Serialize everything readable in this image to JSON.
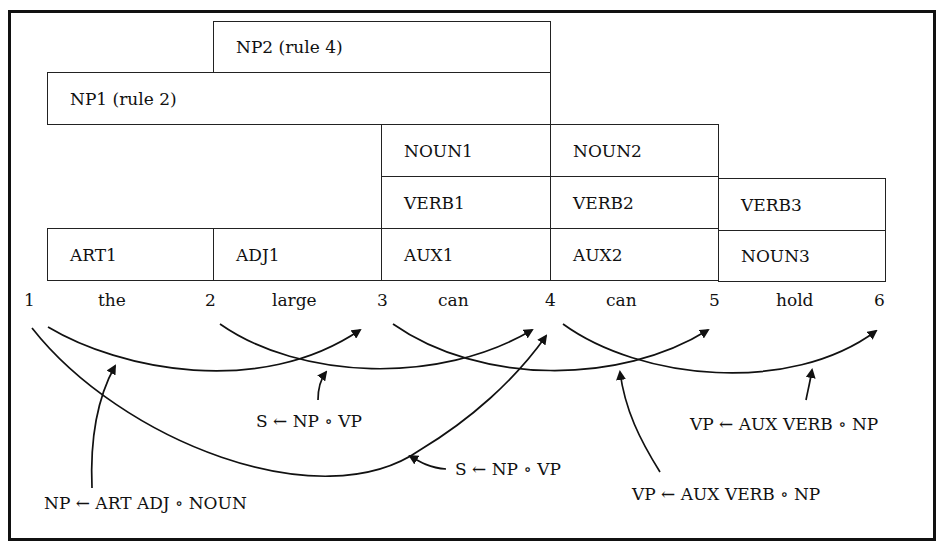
{
  "chart": {
    "rows": {
      "np2": {
        "label": "NP2 (rule 4)"
      },
      "np1": {
        "label": "NP1 (rule 2)"
      },
      "noun1": {
        "label": "NOUN1"
      },
      "noun2": {
        "label": "NOUN2"
      },
      "verb1": {
        "label": "VERB1"
      },
      "verb2": {
        "label": "VERB2"
      },
      "verb3": {
        "label": "VERB3"
      },
      "art1": {
        "label": "ART1"
      },
      "adj1": {
        "label": "ADJ1"
      },
      "aux1": {
        "label": "AUX1"
      },
      "aux2": {
        "label": "AUX2"
      },
      "noun3": {
        "label": "NOUN3"
      }
    },
    "positions": [
      "1",
      "2",
      "3",
      "4",
      "5",
      "6"
    ],
    "words": [
      "the",
      "large",
      "can",
      "can",
      "hold"
    ]
  },
  "active_arcs": [
    {
      "label": "NP ← ART ADJ ∘ NOUN",
      "from": 1,
      "to": 3
    },
    {
      "label": "S ← NP ∘ VP",
      "from": 2,
      "to": 4
    },
    {
      "label": "S ← NP ∘ VP",
      "from": 1,
      "to": 4
    },
    {
      "label": "VP ← AUX VERB ∘ NP",
      "from": 3,
      "to": 5
    },
    {
      "label": "VP ← AUX VERB ∘ NP",
      "from": 4,
      "to": 6
    }
  ]
}
